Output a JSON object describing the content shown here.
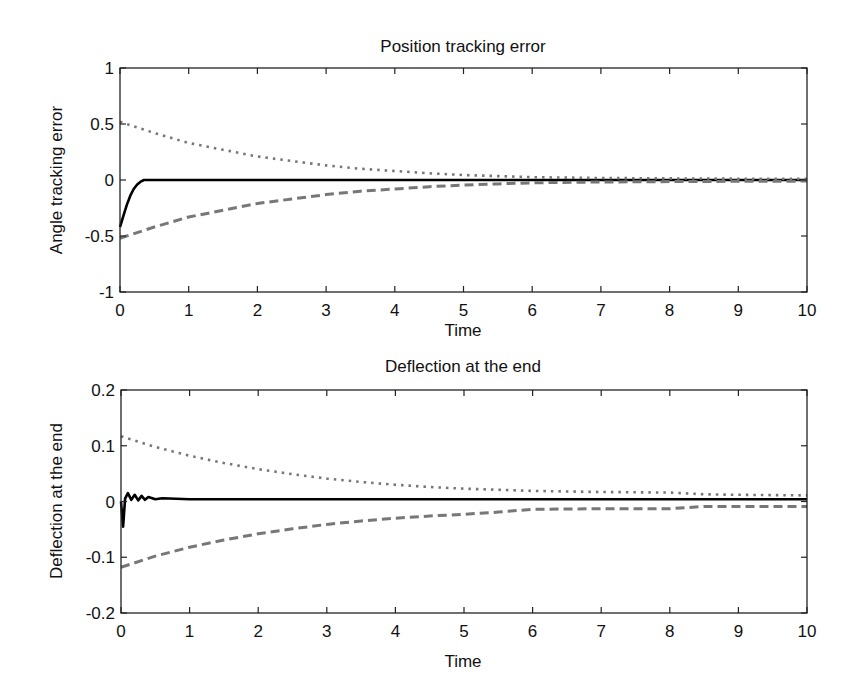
{
  "chart_data": [
    {
      "type": "line",
      "title": "Position tracking error",
      "xlabel": "Time",
      "ylabel": "Angle tracking error",
      "xlim": [
        0,
        10
      ],
      "ylim": [
        -1,
        1
      ],
      "xticks": [
        "0",
        "1",
        "2",
        "3",
        "4",
        "5",
        "6",
        "7",
        "8",
        "9",
        "10"
      ],
      "yticks": [
        "1",
        "0.5",
        "0",
        "-0.5",
        "-1"
      ],
      "grid": false,
      "legend": null,
      "series": [
        {
          "name": "tracking error",
          "style": "solid",
          "color": "#000000",
          "x": [
            0,
            0.05,
            0.1,
            0.15,
            0.2,
            0.25,
            0.3,
            0.35,
            0.4,
            1,
            2,
            3,
            4,
            5,
            6,
            7,
            8,
            9,
            10
          ],
          "y": [
            -0.42,
            -0.32,
            -0.22,
            -0.14,
            -0.08,
            -0.04,
            -0.015,
            0,
            0,
            0,
            0,
            0,
            0,
            0,
            0,
            0,
            0,
            0,
            0
          ]
        },
        {
          "name": "upper bound",
          "style": "dotted",
          "color": "#777777",
          "x": [
            0,
            0.5,
            1,
            1.5,
            2,
            2.5,
            3,
            3.5,
            4,
            4.5,
            5,
            5.5,
            6,
            7,
            8,
            9,
            10
          ],
          "y": [
            0.52,
            0.42,
            0.33,
            0.27,
            0.21,
            0.17,
            0.13,
            0.1,
            0.08,
            0.06,
            0.045,
            0.035,
            0.025,
            0.018,
            0.014,
            0.012,
            0.01
          ]
        },
        {
          "name": "lower bound",
          "style": "dashed",
          "color": "#777777",
          "x": [
            0,
            0.5,
            1,
            1.5,
            2,
            2.5,
            3,
            3.5,
            4,
            4.5,
            5,
            5.5,
            6,
            7,
            8,
            9,
            10
          ],
          "y": [
            -0.52,
            -0.42,
            -0.33,
            -0.27,
            -0.21,
            -0.17,
            -0.13,
            -0.1,
            -0.08,
            -0.06,
            -0.045,
            -0.035,
            -0.025,
            -0.018,
            -0.014,
            -0.012,
            -0.01
          ]
        }
      ]
    },
    {
      "type": "line",
      "title": "Deflection at the end",
      "xlabel": "Time",
      "ylabel": "Deflection at the end",
      "xlim": [
        0,
        10
      ],
      "ylim": [
        -0.2,
        0.2
      ],
      "xticks": [
        "0",
        "1",
        "2",
        "3",
        "4",
        "5",
        "6",
        "7",
        "8",
        "9",
        "10"
      ],
      "yticks": [
        "0.2",
        "0.1",
        "0",
        "-0.1",
        "-0.2"
      ],
      "grid": false,
      "legend": null,
      "series": [
        {
          "name": "deflection",
          "style": "solid",
          "color": "#000000",
          "x": [
            0,
            0.03,
            0.06,
            0.1,
            0.15,
            0.2,
            0.25,
            0.3,
            0.35,
            0.4,
            0.5,
            0.6,
            1,
            2,
            3,
            4,
            5,
            6,
            7,
            8,
            9,
            10
          ],
          "y": [
            0,
            -0.045,
            0.005,
            0.015,
            0.003,
            0.012,
            0.002,
            0.01,
            0.003,
            0.008,
            0.004,
            0.006,
            0.004,
            0.004,
            0.004,
            0.004,
            0.004,
            0.004,
            0.004,
            0.004,
            0.004,
            0.004
          ]
        },
        {
          "name": "upper bound",
          "style": "dotted",
          "color": "#777777",
          "x": [
            0,
            0.5,
            1,
            1.5,
            2,
            2.5,
            3,
            3.5,
            4,
            4.5,
            5,
            5.5,
            6,
            7,
            8,
            8.5,
            9,
            10
          ],
          "y": [
            0.117,
            0.098,
            0.082,
            0.069,
            0.058,
            0.049,
            0.041,
            0.035,
            0.03,
            0.026,
            0.023,
            0.021,
            0.019,
            0.017,
            0.016,
            0.013,
            0.012,
            0.011
          ]
        },
        {
          "name": "lower bound",
          "style": "dashed",
          "color": "#777777",
          "x": [
            0,
            0.5,
            1,
            1.5,
            2,
            2.5,
            3,
            3.5,
            4,
            4.5,
            5,
            5.5,
            6,
            7,
            8,
            8.5,
            9,
            10
          ],
          "y": [
            -0.118,
            -0.098,
            -0.082,
            -0.069,
            -0.058,
            -0.049,
            -0.041,
            -0.035,
            -0.03,
            -0.026,
            -0.023,
            -0.019,
            -0.014,
            -0.013,
            -0.013,
            -0.009,
            -0.009,
            -0.009
          ]
        }
      ]
    }
  ]
}
